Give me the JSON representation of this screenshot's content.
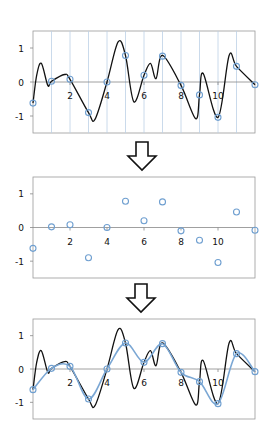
{
  "figure": {
    "steps": [
      {
        "name": "continuous-signal-with-sampling-grid",
        "panel": "top"
      },
      {
        "name": "sampled-points",
        "panel": "middle"
      },
      {
        "name": "interpolated-reconstruction",
        "panel": "bottom"
      }
    ],
    "arrows": [
      {
        "name": "arrow-1",
        "direction": "down"
      },
      {
        "name": "arrow-2",
        "direction": "down"
      }
    ],
    "colors": {
      "signal": "#111111",
      "samples": "#6f9fd0",
      "interpolation": "#7ba7d4",
      "grid": "#bcd0e6",
      "axis": "#888888",
      "frame": "#9a9a9a"
    }
  },
  "axes": {
    "x_ticks": [
      {
        "value": 2,
        "label": "2"
      },
      {
        "value": 4,
        "label": "4"
      },
      {
        "value": 6,
        "label": "6"
      },
      {
        "value": 8,
        "label": "8"
      },
      {
        "value": 10,
        "label": "10"
      }
    ],
    "y_ticks": [
      {
        "value": 1,
        "label": "1"
      },
      {
        "value": 0,
        "label": "0"
      },
      {
        "value": -1,
        "label": "-1"
      }
    ],
    "xlim": [
      0,
      12
    ],
    "ylim": [
      -1.5,
      1.5
    ]
  },
  "chart_data": [
    {
      "type": "line",
      "title": "Continuous signal with sampling instants",
      "xlabel": "",
      "ylabel": "",
      "xlim": [
        0,
        12
      ],
      "ylim": [
        -1.5,
        1.5
      ],
      "grid": "vertical lines at every integer x",
      "series": [
        {
          "name": "signal",
          "x": [
            0,
            0.2,
            0.45,
            0.8,
            1,
            1.7,
            2,
            3,
            3.35,
            4,
            4.6,
            5,
            5.45,
            6,
            6.35,
            6.65,
            7,
            8,
            8.8,
            9,
            9.2,
            10,
            10.6,
            11,
            12
          ],
          "y": [
            -0.62,
            0.2,
            0.55,
            -0.1,
            0.02,
            0.22,
            0.08,
            -0.9,
            -1.1,
            0.0,
            1.18,
            0.78,
            -0.58,
            0.2,
            0.55,
            0.1,
            0.78,
            -0.1,
            -1.08,
            -0.38,
            0.25,
            -1.04,
            0.78,
            0.46,
            -0.08
          ]
        },
        {
          "name": "samples",
          "x": [
            0,
            1,
            2,
            3,
            4,
            5,
            6,
            7,
            8,
            9,
            10,
            11,
            12
          ],
          "y": [
            -0.62,
            0.02,
            0.08,
            -0.9,
            0.0,
            0.78,
            0.2,
            0.76,
            -0.1,
            -0.38,
            -1.04,
            0.46,
            -0.08
          ]
        }
      ]
    },
    {
      "type": "scatter",
      "title": "Sampled values",
      "xlabel": "",
      "ylabel": "",
      "xlim": [
        0,
        12
      ],
      "ylim": [
        -1.5,
        1.5
      ],
      "series": [
        {
          "name": "samples",
          "x": [
            0,
            1,
            2,
            3,
            4,
            5,
            6,
            7,
            8,
            9,
            10,
            11,
            12
          ],
          "y": [
            -0.62,
            0.02,
            0.08,
            -0.9,
            0.0,
            0.78,
            0.2,
            0.76,
            -0.1,
            -0.38,
            -1.04,
            0.46,
            -0.08
          ]
        }
      ]
    },
    {
      "type": "line",
      "title": "Reconstruction from samples vs. original",
      "xlabel": "",
      "ylabel": "",
      "xlim": [
        0,
        12
      ],
      "ylim": [
        -1.5,
        1.5
      ],
      "series": [
        {
          "name": "original-signal",
          "x": [
            0,
            0.2,
            0.45,
            0.8,
            1,
            1.7,
            2,
            3,
            3.35,
            4,
            4.6,
            5,
            5.45,
            6,
            6.35,
            6.65,
            7,
            8,
            8.8,
            9,
            9.2,
            10,
            10.6,
            11,
            12
          ],
          "y": [
            -0.62,
            0.2,
            0.55,
            -0.1,
            0.02,
            0.22,
            0.08,
            -0.9,
            -1.1,
            0.0,
            1.18,
            0.78,
            -0.58,
            0.2,
            0.55,
            0.1,
            0.78,
            -0.1,
            -1.08,
            -0.38,
            0.25,
            -1.04,
            0.78,
            0.46,
            -0.08
          ]
        },
        {
          "name": "interpolated",
          "x": [
            0,
            1,
            2,
            3,
            4,
            5,
            6,
            7,
            8,
            9,
            10,
            11,
            12
          ],
          "y": [
            -0.62,
            0.02,
            0.08,
            -0.9,
            0.0,
            0.78,
            0.2,
            0.76,
            -0.1,
            -0.38,
            -1.04,
            0.46,
            -0.08
          ]
        }
      ]
    }
  ]
}
